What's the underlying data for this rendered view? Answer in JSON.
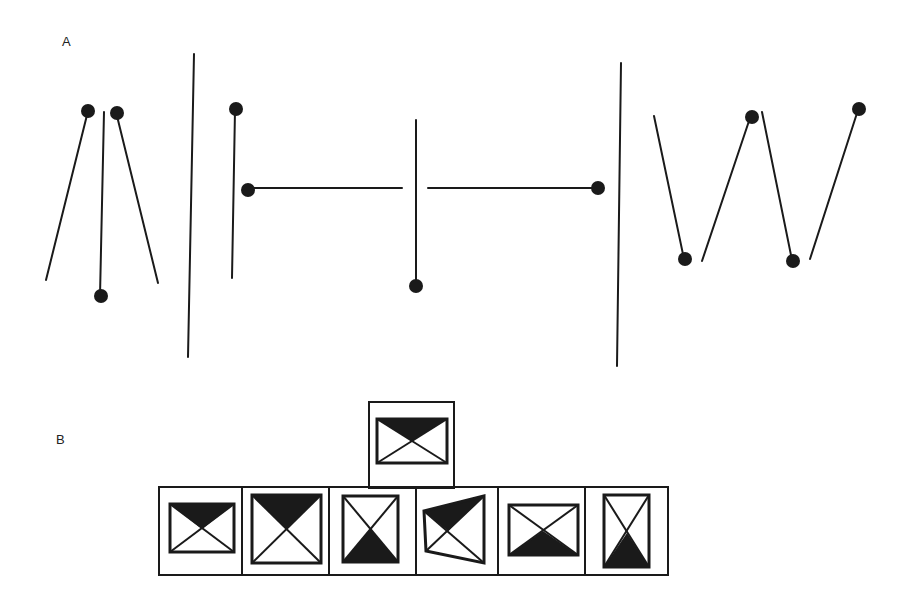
{
  "panels": {
    "a": {
      "label": "A"
    },
    "b": {
      "label": "B"
    }
  },
  "colors": {
    "ink": "#1a1a1a",
    "paper": "#ffffff"
  },
  "panel_a": {
    "groups": [
      {
        "name": "converging-lines-group",
        "description": "three lines with dots forming inverted-V pattern"
      },
      {
        "name": "t-junction-group",
        "description": "vertical and horizontal lines with dots forming T shape"
      },
      {
        "name": "zigzag-w-group",
        "description": "four lines with dots forming W shape"
      }
    ],
    "dividers": 2
  },
  "panel_b": {
    "target": {
      "shape": "rectangle",
      "shaded": "top triangle"
    },
    "options": [
      {
        "shape": "rectangle",
        "shaded": "top triangle"
      },
      {
        "shape": "square",
        "shaded": "top triangle"
      },
      {
        "shape": "tall rectangle",
        "shaded": "bottom triangle"
      },
      {
        "shape": "trapezoid",
        "shaded": "top triangle"
      },
      {
        "shape": "rectangle",
        "shaded": "bottom triangle"
      },
      {
        "shape": "tall narrow rectangle",
        "shaded": "bottom triangle"
      }
    ]
  }
}
